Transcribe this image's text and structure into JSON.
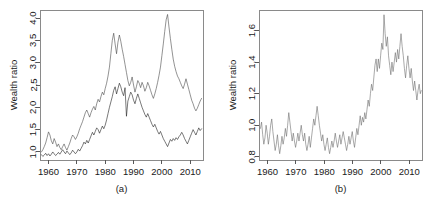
{
  "figure": {
    "background": "#ffffff",
    "width": 439,
    "height": 212
  },
  "panel_a": {
    "caption": "(a)",
    "ylabel": "Wealth ratio",
    "xlabel": "",
    "ytick_labels": [
      "1.0",
      "1.5",
      "2.0",
      "2.5",
      "3.0",
      "3.5",
      "4.0"
    ],
    "xtick_labels": [
      "1960",
      "1970",
      "1980",
      "1990",
      "2000",
      "2010"
    ]
  },
  "panel_b": {
    "caption": "(b)",
    "ylabel": "Wealth ratio",
    "xlabel": "",
    "ytick_labels": [
      "0.8",
      "1.0",
      "1.2",
      "1.4",
      "1.6"
    ],
    "xtick_labels": [
      "1960",
      "1970",
      "1980",
      "1990",
      "2000",
      "2010"
    ]
  },
  "chart_data": [
    {
      "type": "line",
      "panel": "(a)",
      "title": "",
      "xlabel": "",
      "ylabel": "Wealth ratio",
      "xlim": [
        1957.0,
        2014.5
      ],
      "ylim": [
        0.82,
        4.18
      ],
      "xticks": [
        1960,
        1970,
        1980,
        1990,
        2000,
        2010
      ],
      "yticks": [
        1.0,
        1.5,
        2.0,
        2.5,
        3.0,
        3.5,
        4.0
      ],
      "grid": false,
      "legend": "none",
      "line_color": "#3c3c3c",
      "series": [
        {
          "name": "series-1",
          "color": "#4a4a4a",
          "x": [
            1957.5,
            1958.0,
            1958.5,
            1959.0,
            1959.5,
            1960.0,
            1960.5,
            1961.0,
            1961.5,
            1962.0,
            1962.5,
            1963.0,
            1963.5,
            1964.0,
            1964.5,
            1965.0,
            1965.5,
            1966.0,
            1966.5,
            1967.0,
            1967.5,
            1968.0,
            1968.5,
            1969.0,
            1969.5,
            1970.0,
            1970.5,
            1971.0,
            1971.5,
            1972.0,
            1972.5,
            1973.0,
            1973.5,
            1974.0,
            1974.5,
            1975.0,
            1975.5,
            1976.0,
            1976.5,
            1977.0,
            1977.5,
            1978.0,
            1978.5,
            1979.0,
            1979.5,
            1980.0,
            1980.5,
            1981.0,
            1981.5,
            1982.0,
            1982.5,
            1983.0,
            1983.5,
            1984.0,
            1984.5,
            1985.0,
            1985.5,
            1986.0,
            1986.5,
            1987.0,
            1987.5,
            1988.0,
            1988.5,
            1989.0,
            1989.5,
            1990.0,
            1990.5,
            1991.0,
            1991.5,
            1992.0,
            1992.5,
            1993.0,
            1993.5,
            1994.0,
            1994.5,
            1995.0,
            1995.5,
            1996.0,
            1996.5,
            1997.0,
            1997.5,
            1998.0,
            1998.5,
            1999.0,
            1999.5,
            2000.0,
            2000.5,
            2001.0,
            2001.5,
            2002.0,
            2002.5,
            2003.0,
            2003.5,
            2004.0,
            2004.5,
            2005.0,
            2005.5,
            2006.0,
            2006.5,
            2007.0,
            2007.5,
            2008.0,
            2008.5,
            2009.0,
            2009.5,
            2010.0,
            2010.5,
            2011.0,
            2011.5,
            2012.0,
            2012.5,
            2013.0,
            2013.5,
            2014.0
          ],
          "y": [
            1.0,
            1.05,
            1.12,
            1.2,
            1.32,
            1.45,
            1.38,
            1.25,
            1.18,
            1.3,
            1.22,
            1.12,
            1.18,
            1.1,
            1.05,
            1.12,
            1.18,
            1.1,
            1.04,
            1.12,
            1.2,
            1.3,
            1.38,
            1.34,
            1.28,
            1.34,
            1.42,
            1.52,
            1.6,
            1.68,
            1.78,
            1.88,
            1.94,
            1.86,
            1.78,
            1.88,
            1.96,
            2.02,
            1.94,
            2.08,
            2.18,
            2.12,
            2.24,
            2.34,
            2.28,
            2.42,
            2.54,
            2.7,
            2.9,
            3.2,
            3.5,
            3.66,
            3.42,
            3.2,
            3.46,
            3.62,
            3.48,
            3.3,
            3.14,
            2.96,
            2.78,
            2.6,
            2.48,
            2.56,
            2.68,
            2.5,
            2.34,
            2.46,
            2.6,
            2.54,
            2.44,
            2.56,
            2.48,
            2.36,
            2.44,
            2.56,
            2.48,
            2.38,
            2.28,
            2.2,
            2.3,
            2.42,
            2.56,
            2.72,
            2.9,
            3.16,
            3.42,
            3.7,
            3.96,
            4.08,
            3.8,
            3.54,
            3.3,
            3.08,
            2.92,
            2.8,
            2.7,
            2.64,
            2.56,
            2.48,
            2.42,
            2.52,
            2.64,
            2.52,
            2.4,
            2.28,
            2.16,
            2.08,
            1.98,
            1.92,
            1.98,
            2.06,
            2.14,
            2.2
          ]
        },
        {
          "name": "series-2",
          "color": "#1f1f1f",
          "x": [
            1957.5,
            1958.0,
            1958.5,
            1959.0,
            1959.5,
            1960.0,
            1960.5,
            1961.0,
            1961.5,
            1962.0,
            1962.5,
            1963.0,
            1963.5,
            1964.0,
            1964.5,
            1965.0,
            1965.5,
            1966.0,
            1966.5,
            1967.0,
            1967.5,
            1968.0,
            1968.5,
            1969.0,
            1969.5,
            1970.0,
            1970.5,
            1971.0,
            1971.5,
            1972.0,
            1972.5,
            1973.0,
            1973.5,
            1974.0,
            1974.5,
            1975.0,
            1975.5,
            1976.0,
            1976.5,
            1977.0,
            1977.5,
            1978.0,
            1978.5,
            1979.0,
            1979.5,
            1980.0,
            1980.5,
            1981.0,
            1981.5,
            1982.0,
            1982.5,
            1983.0,
            1983.5,
            1984.0,
            1984.5,
            1985.0,
            1985.5,
            1986.0,
            1986.5,
            1987.0,
            1987.5,
            1988.0,
            1988.5,
            1989.0,
            1989.5,
            1990.0,
            1990.5,
            1991.0,
            1991.5,
            1992.0,
            1992.5,
            1993.0,
            1993.5,
            1994.0,
            1994.5,
            1995.0,
            1995.5,
            1996.0,
            1996.5,
            1997.0,
            1997.5,
            1998.0,
            1998.5,
            1999.0,
            1999.5,
            2000.0,
            2000.5,
            2001.0,
            2001.5,
            2002.0,
            2002.5,
            2003.0,
            2003.5,
            2004.0,
            2004.5,
            2005.0,
            2005.5,
            2006.0,
            2006.5,
            2007.0,
            2007.5,
            2008.0,
            2008.5,
            2009.0,
            2009.5,
            2010.0,
            2010.5,
            2011.0,
            2011.5,
            2012.0,
            2012.5,
            2013.0,
            2013.5,
            2014.0
          ],
          "y": [
            0.94,
            0.9,
            0.93,
            0.97,
            0.92,
            0.96,
            0.91,
            0.95,
            1.0,
            0.96,
            0.92,
            0.95,
            0.99,
            0.95,
            1.0,
            1.05,
            1.0,
            0.96,
            1.02,
            0.98,
            0.94,
            0.98,
            1.04,
            1.0,
            0.96,
            1.0,
            1.06,
            1.02,
            1.08,
            1.14,
            1.22,
            1.18,
            1.26,
            1.2,
            1.28,
            1.36,
            1.44,
            1.38,
            1.46,
            1.54,
            1.5,
            1.42,
            1.5,
            1.58,
            1.52,
            1.6,
            1.72,
            1.86,
            2.0,
            2.12,
            2.24,
            2.38,
            2.46,
            2.3,
            2.42,
            2.54,
            2.46,
            2.34,
            2.26,
            2.44,
            1.8,
            2.14,
            2.24,
            2.34,
            2.28,
            2.16,
            2.08,
            2.2,
            2.3,
            2.2,
            2.1,
            2.0,
            1.92,
            1.84,
            1.78,
            1.86,
            1.78,
            1.7,
            1.62,
            1.56,
            1.62,
            1.54,
            1.46,
            1.4,
            1.46,
            1.38,
            1.3,
            1.24,
            1.18,
            1.12,
            1.2,
            1.28,
            1.24,
            1.3,
            1.26,
            1.32,
            1.28,
            1.34,
            1.38,
            1.44,
            1.38,
            1.3,
            1.24,
            1.18,
            1.26,
            1.34,
            1.42,
            1.5,
            1.44,
            1.38,
            1.46,
            1.54,
            1.48,
            1.52
          ]
        }
      ]
    },
    {
      "type": "line",
      "panel": "(b)",
      "title": "",
      "xlabel": "",
      "ylabel": "Wealth ratio",
      "xlim": [
        1957.0,
        2014.5
      ],
      "ylim": [
        0.78,
        1.73
      ],
      "xticks": [
        1960,
        1970,
        1980,
        1990,
        2000,
        2010
      ],
      "yticks": [
        0.8,
        1.0,
        1.2,
        1.4,
        1.6
      ],
      "grid": false,
      "legend": "none",
      "line_color": "#6e6e6e",
      "series": [
        {
          "name": "series-1",
          "color": "#6e6e6e",
          "x": [
            1957.5,
            1957.9,
            1958.3,
            1958.7,
            1959.1,
            1959.5,
            1959.9,
            1960.3,
            1960.7,
            1961.1,
            1961.5,
            1961.9,
            1962.3,
            1962.7,
            1963.1,
            1963.5,
            1963.9,
            1964.3,
            1964.7,
            1965.1,
            1965.5,
            1965.9,
            1966.3,
            1966.7,
            1967.1,
            1967.5,
            1967.9,
            1968.3,
            1968.7,
            1969.1,
            1969.5,
            1969.9,
            1970.3,
            1970.7,
            1971.1,
            1971.5,
            1971.9,
            1972.3,
            1972.7,
            1973.1,
            1973.5,
            1973.9,
            1974.3,
            1974.7,
            1975.1,
            1975.5,
            1975.9,
            1976.3,
            1976.7,
            1977.1,
            1977.5,
            1977.9,
            1978.3,
            1978.7,
            1979.1,
            1979.5,
            1979.9,
            1980.3,
            1980.7,
            1981.1,
            1981.5,
            1981.9,
            1982.3,
            1982.7,
            1983.1,
            1983.5,
            1983.9,
            1984.3,
            1984.7,
            1985.1,
            1985.5,
            1985.9,
            1986.3,
            1986.7,
            1987.1,
            1987.5,
            1987.9,
            1988.3,
            1988.7,
            1989.1,
            1989.5,
            1989.9,
            1990.3,
            1990.7,
            1991.1,
            1991.5,
            1991.9,
            1992.3,
            1992.7,
            1993.1,
            1993.5,
            1993.9,
            1994.3,
            1994.7,
            1995.1,
            1995.5,
            1995.9,
            1996.3,
            1996.7,
            1997.1,
            1997.5,
            1997.9,
            1998.3,
            1998.7,
            1999.1,
            1999.5,
            1999.9,
            2000.3,
            2000.7,
            2001.1,
            2001.5,
            2001.9,
            2002.3,
            2002.7,
            2003.1,
            2003.5,
            2003.9,
            2004.3,
            2004.7,
            2005.1,
            2005.5,
            2005.9,
            2006.3,
            2006.7,
            2007.1,
            2007.5,
            2007.9,
            2008.3,
            2008.7,
            2009.1,
            2009.5,
            2009.9,
            2010.3,
            2010.7,
            2011.1,
            2011.5,
            2011.9,
            2012.3,
            2012.7,
            2013.1,
            2013.5,
            2013.9,
            2014.2
          ],
          "y": [
            0.98,
            1.02,
            0.94,
            0.88,
            0.92,
            1.0,
            0.95,
            0.88,
            0.93,
            1.0,
            1.04,
            0.96,
            0.9,
            0.84,
            0.88,
            0.94,
            0.87,
            0.82,
            0.87,
            0.93,
            0.88,
            0.92,
            0.98,
            0.93,
            1.0,
            1.08,
            1.02,
            0.96,
            0.9,
            0.95,
            0.9,
            0.86,
            0.9,
            0.95,
            0.9,
            0.95,
            1.0,
            0.94,
            0.9,
            0.95,
            0.88,
            0.84,
            0.88,
            0.93,
            0.86,
            0.92,
            0.98,
            1.04,
            1.0,
            1.06,
            1.12,
            1.06,
            1.0,
            0.95,
            0.9,
            0.94,
            0.88,
            0.84,
            0.88,
            0.92,
            0.86,
            0.82,
            0.86,
            0.9,
            0.86,
            0.9,
            0.95,
            0.9,
            0.86,
            0.9,
            0.94,
            0.88,
            0.92,
            0.96,
            0.92,
            0.88,
            0.84,
            0.88,
            0.93,
            0.88,
            0.92,
            0.96,
            0.9,
            0.86,
            0.92,
            0.98,
            0.94,
            1.0,
            1.06,
            1.0,
            1.05,
            1.02,
            1.08,
            1.04,
            1.1,
            1.16,
            1.12,
            1.2,
            1.26,
            1.22,
            1.3,
            1.38,
            1.42,
            1.34,
            1.42,
            1.36,
            1.44,
            1.52,
            1.48,
            1.7,
            1.58,
            1.5,
            1.56,
            1.44,
            1.38,
            1.32,
            1.4,
            1.34,
            1.4,
            1.46,
            1.4,
            1.48,
            1.42,
            1.5,
            1.58,
            1.5,
            1.44,
            1.36,
            1.3,
            1.38,
            1.44,
            1.36,
            1.3,
            1.36,
            1.28,
            1.22,
            1.28,
            1.22,
            1.16,
            1.22,
            1.26,
            1.2,
            1.22
          ]
        }
      ]
    }
  ]
}
